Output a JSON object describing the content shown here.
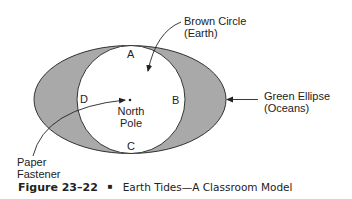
{
  "diagram": {
    "labels": {
      "brown_circle": [
        "Brown Circle",
        "(Earth)"
      ],
      "green_ellipse": [
        "Green Ellipse",
        "(Oceans)"
      ],
      "paper_fastener": [
        "Paper",
        "Fastener"
      ],
      "north_pole": [
        "North",
        "Pole"
      ]
    },
    "points": {
      "a": "A",
      "b": "B",
      "c": "C",
      "d": "D"
    },
    "colors": {
      "ocean_fill": "#a9a9a9",
      "earth_fill": "#ffffff",
      "stroke": "#333333"
    }
  },
  "caption": {
    "figure_number": "Figure 23–22",
    "bullet": "■",
    "title": "Earth Tides—A Classroom Model"
  }
}
